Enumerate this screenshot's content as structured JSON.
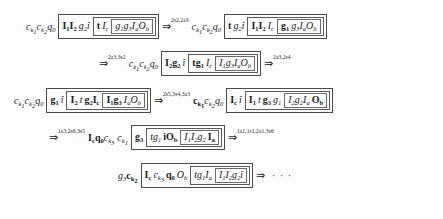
{
  "document": {
    "kind": "formal-derivation-sequence",
    "notation": "nested bracket configurations with double-arrow rewrite steps",
    "lines": [
      {
        "id": "line-1",
        "left_context": "c_{k1} c_{k2} q_0",
        "config": "[ I1 I2 g2 î [ t I_c [ g1 g3 I_a O_b ] ] ]",
        "arrow_label": "2s2,2a3",
        "right_context": "c_{k1} c_{k2} q_0",
        "right_config": "[ t g2 î [ I1 I2 I_c [ g1 g3 I_a O_b ] ] ]"
      },
      {
        "id": "line-2",
        "arrow_label": "2a3,3s2",
        "left_context": "c_{k1} c_{k2} q_0",
        "config": "[ I2 g2 î [ t g1 I_c [ I1 g3 I_a O_b ] ] ]",
        "trailing_arrow_label": "2a3,2s4"
      },
      {
        "id": "line-3",
        "left_context": "c_{k1} c_{k2} q_0",
        "config": "[ g1 î [ I2 t g2 I_c [ I1 g3 I_a O_b ] ] ]",
        "arrow_label": "2s5,3s4,3a3",
        "right_context": "c_{k1} c_{k2} q_0",
        "right_config": "[ I_c î [ I1 t g3 g1 [ I2 g2 I_a O_b ] ] ]"
      },
      {
        "id": "line-4",
        "arrow_label": "1a3,2s6,3s5",
        "left_context": "I_c q_0 c_{k3}  c_{k1}",
        "config": "[ g3 [ t g1 i O_b [ I1 I2 g2 I_a ] ] ]",
        "trailing_arrow_label": "1a1,1s1,2a1,3s6"
      },
      {
        "id": "line-5",
        "left_context": "g3 c_{k2}",
        "config": "[ I_c c_{k1} q_0 O_b [ t g1 I_a [ I1 I2 g2 î ] ] ]",
        "trailing": "⇒ · · ·"
      }
    ],
    "arrow_glyph": "⇒",
    "ellipsis": "· · ·",
    "tokens": {
      "l1_pre": "c",
      "l1_sub1": "k1",
      "l1_sub2": "k2",
      "q": "q",
      "q_sub": "0"
    }
  },
  "colors": {
    "background": "#fdfdfd",
    "text": "#1a1a1a",
    "box_border": "#555555"
  }
}
